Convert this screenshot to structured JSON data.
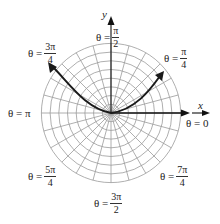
{
  "diagram": {
    "type": "polar-grid-with-curve",
    "center": {
      "x": 111,
      "y": 113
    },
    "ring_count": 8,
    "ring_spacing": 8.7,
    "spoke_step_degrees": 15,
    "colors": {
      "grid": "#9a9a9a",
      "curve": "#1a1a1a",
      "axis": "#111111",
      "text": "#222222"
    },
    "axes": {
      "x_label": "x",
      "y_label": "y"
    },
    "angle_labels": [
      {
        "id": "theta-0",
        "prefix": "θ = 0",
        "num": "",
        "den": ""
      },
      {
        "id": "theta-pi-4",
        "prefix": "θ =",
        "num": "π",
        "den": "4"
      },
      {
        "id": "theta-pi-2",
        "prefix": "θ =",
        "num": "π",
        "den": "2"
      },
      {
        "id": "theta-3pi-4",
        "prefix": "θ =",
        "num": "3π",
        "den": "4"
      },
      {
        "id": "theta-pi",
        "prefix": "θ = π",
        "num": "",
        "den": ""
      },
      {
        "id": "theta-5pi-4",
        "prefix": "θ =",
        "num": "5π",
        "den": "4"
      },
      {
        "id": "theta-3pi-2",
        "prefix": "θ =",
        "num": "3π",
        "den": "2"
      },
      {
        "id": "theta-7pi-4",
        "prefix": "θ =",
        "num": "7π",
        "den": "4"
      }
    ]
  }
}
